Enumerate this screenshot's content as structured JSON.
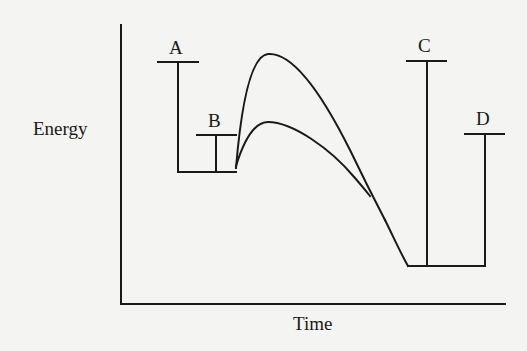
{
  "diagram": {
    "type": "energy-profile",
    "axes": {
      "y_label": "Energy",
      "x_label": "Time"
    },
    "markers": [
      {
        "id": "A",
        "label": "A"
      },
      {
        "id": "B",
        "label": "B"
      },
      {
        "id": "C",
        "label": "C"
      },
      {
        "id": "D",
        "label": "D"
      }
    ],
    "curves": [
      {
        "name": "uncatalyzed-path",
        "description": "higher activation energy curve"
      },
      {
        "name": "catalyzed-path",
        "description": "lower activation energy curve"
      }
    ],
    "colors": {
      "ink": "#1a1a1a",
      "background": "#f4f4f2"
    }
  }
}
